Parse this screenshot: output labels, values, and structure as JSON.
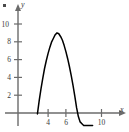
{
  "figure": {
    "corner_mark": "bullet-mark",
    "background_color": "#ffffff",
    "curve_color": "#000000",
    "axis_color": "#6b6b6b"
  },
  "chart_data": {
    "type": "line",
    "title": "",
    "subtitle": "",
    "xlabel": "x",
    "ylabel": "y",
    "grid": false,
    "legend": null,
    "xlim": [
      -1.2,
      12.3
    ],
    "ylim": [
      -1.5,
      12.2
    ],
    "xticks": [
      4,
      6,
      10
    ],
    "xtick_labels": [
      "4",
      "6",
      "10"
    ],
    "yticks": [
      2,
      4,
      6,
      8,
      10
    ],
    "ytick_labels": [
      "2",
      "4",
      "6",
      "8",
      "10"
    ],
    "axis_arrows": [
      "x-positive",
      "y-positive"
    ],
    "series": [
      {
        "name": "parabola",
        "equation": "y = -(x - 5)^2 + 9",
        "vertex": [
          5,
          9
        ],
        "roots": [
          2,
          8
        ],
        "x": [
          2.8,
          3.0,
          3.2,
          3.4,
          3.6,
          3.8,
          4.0,
          4.2,
          4.4,
          4.6,
          4.8,
          5.0,
          5.2,
          5.4,
          5.6,
          5.8,
          6.0,
          6.2,
          6.4,
          6.6,
          6.8,
          7.0,
          7.2,
          7.4,
          7.6,
          7.8,
          8.0,
          8.2,
          8.4,
          8.6,
          8.8,
          9.0
        ],
        "values": [
          -0.1,
          1.4,
          2.7,
          3.9,
          5.0,
          5.9,
          6.7,
          7.4,
          8.0,
          8.4,
          8.8,
          9.0,
          8.9,
          8.6,
          8.2,
          7.6,
          6.9,
          6.1,
          5.2,
          4.2,
          3.1,
          1.9,
          0.6,
          -0.4,
          -1.0,
          -1.2,
          -1.4,
          -1.4,
          -1.4,
          -1.4,
          -1.4,
          -1.4
        ]
      }
    ]
  }
}
